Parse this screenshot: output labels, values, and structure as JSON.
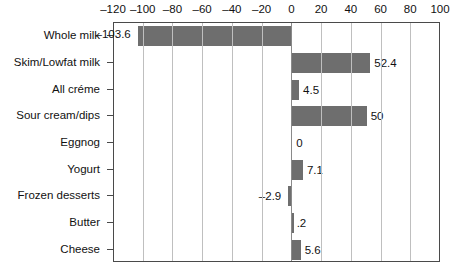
{
  "chart_data": {
    "type": "bar",
    "orientation": "horizontal",
    "title": "",
    "subtitle": "",
    "xlabel": "",
    "ylabel": "",
    "xlim": [
      -120,
      100
    ],
    "xticks": [
      -120,
      -100,
      -80,
      -60,
      -40,
      -20,
      0,
      20,
      40,
      60,
      80,
      100
    ],
    "xtick_labels": [
      "–120",
      "–100",
      "–80",
      "–60",
      "–40",
      "–20",
      "0",
      "20",
      "40",
      "60",
      "80",
      "100"
    ],
    "grid": true,
    "grid_axis": "x",
    "legend": false,
    "bar_color": "#6e6e6e",
    "axis_color": "#4a4a4a",
    "grid_color": "#bfbfbf",
    "categories": [
      "Whole milk",
      "Skim/Lowfat milk",
      "All créme",
      "Sour cream/dips",
      "Eggnog",
      "Yogurt",
      "Frozen desserts",
      "Butter",
      "Cheese"
    ],
    "values": [
      -103.6,
      52.4,
      4.5,
      50,
      0,
      7.1,
      -2.9,
      0.2,
      5.6
    ],
    "value_labels": [
      "–103.6",
      "52.4",
      "4.5",
      "50",
      "0",
      "7.1",
      "–2.9",
      ".2",
      "5.6"
    ]
  }
}
